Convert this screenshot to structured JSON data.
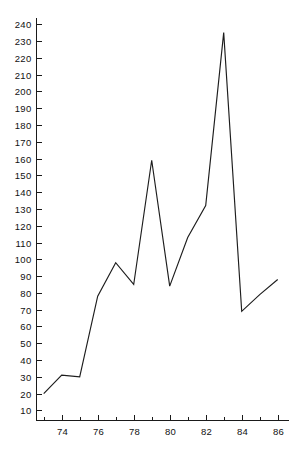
{
  "chart_data": {
    "type": "line",
    "title": "",
    "subtitle": "",
    "xlabel": "",
    "ylabel": "",
    "x": [
      73,
      74,
      75,
      76,
      77,
      78,
      79,
      80,
      81,
      82,
      83,
      84,
      85,
      86
    ],
    "values": [
      20,
      31,
      30,
      78,
      98,
      85,
      159,
      84,
      113,
      132,
      235,
      69,
      79,
      88
    ],
    "series": [
      {
        "name": "series-1",
        "values": [
          20,
          31,
          30,
          78,
          98,
          85,
          159,
          84,
          113,
          132,
          235,
          69,
          79,
          88
        ]
      }
    ],
    "xlim": [
      72.6,
      86.6
    ],
    "ylim": [
      4,
      244
    ],
    "x_tick_values": [
      73,
      74,
      75,
      76,
      77,
      78,
      79,
      80,
      81,
      82,
      83,
      84,
      85,
      86
    ],
    "x_tick_labels": [
      "",
      "74",
      "",
      "76",
      "",
      "78",
      "",
      "80",
      "",
      "82",
      "",
      "84",
      "",
      "86"
    ],
    "y_tick_values": [
      10,
      20,
      30,
      40,
      50,
      60,
      70,
      80,
      90,
      100,
      110,
      120,
      130,
      140,
      150,
      160,
      170,
      180,
      190,
      200,
      210,
      220,
      230,
      240
    ],
    "y_tick_labels": [
      "10",
      "20",
      "30",
      "40",
      "50",
      "60",
      "70",
      "80",
      "90",
      "100",
      "110",
      "120",
      "130",
      "140",
      "150",
      "160",
      "170",
      "180",
      "190",
      "200",
      "210",
      "220",
      "230",
      "240"
    ],
    "grid": false,
    "legend": false,
    "legend_position": "none",
    "line_color": "#1d1d1d",
    "axis_color": "#1a1a1a",
    "background_color": "#ffffff"
  }
}
